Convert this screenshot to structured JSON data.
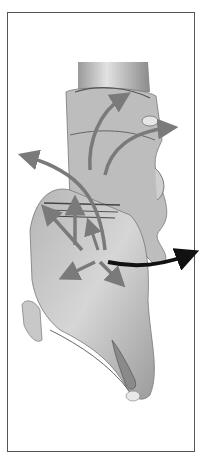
{
  "figure": {
    "style": "grayscale",
    "frame_color": "#555555",
    "background": "#ffffff",
    "tissue_light": "#d4d4d4",
    "tissue_mid": "#a8a8a8",
    "tissue_dark": "#5a5a5a",
    "arrow_gray": "#7a7a7a",
    "arrow_black": "#111111",
    "arrows": [
      {
        "name": "upper-curved-arrow",
        "color": "#7a7a7a"
      },
      {
        "name": "right-curved-arrow",
        "color": "#7a7a7a"
      },
      {
        "name": "left-long-arrow",
        "color": "#7a7a7a"
      },
      {
        "name": "up-arrow",
        "color": "#7a7a7a"
      },
      {
        "name": "upper-left-arrow",
        "color": "#7a7a7a"
      },
      {
        "name": "lower-left-arrow",
        "color": "#7a7a7a"
      },
      {
        "name": "lower-right-arrow",
        "color": "#7a7a7a"
      },
      {
        "name": "right-black-arrow",
        "color": "#111111"
      }
    ]
  }
}
